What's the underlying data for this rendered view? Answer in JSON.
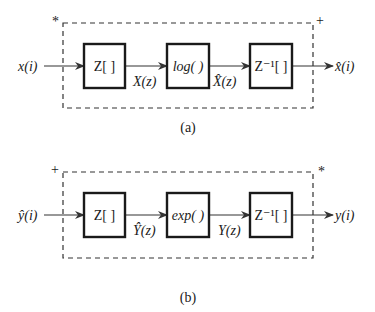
{
  "diagram_a": {
    "caption": "(a)",
    "corner_left": "*",
    "corner_right": "+",
    "input": "x(i)",
    "output": "x̂(i)",
    "blocks": [
      {
        "label": "Z[ ]"
      },
      {
        "label": "log( )"
      },
      {
        "label": "Z⁻¹[ ]"
      }
    ],
    "edges": [
      {
        "label": "X(z)"
      },
      {
        "label": "X̂(z)"
      }
    ]
  },
  "diagram_b": {
    "caption": "(b)",
    "corner_left": "+",
    "corner_right": "*",
    "input": "ŷ(i)",
    "output": "y(i)",
    "blocks": [
      {
        "label": "Z[ ]"
      },
      {
        "label": "exp( )"
      },
      {
        "label": "Z⁻¹[ ]"
      }
    ],
    "edges": [
      {
        "label": "Ŷ(z)"
      },
      {
        "label": "Y(z)"
      }
    ]
  }
}
